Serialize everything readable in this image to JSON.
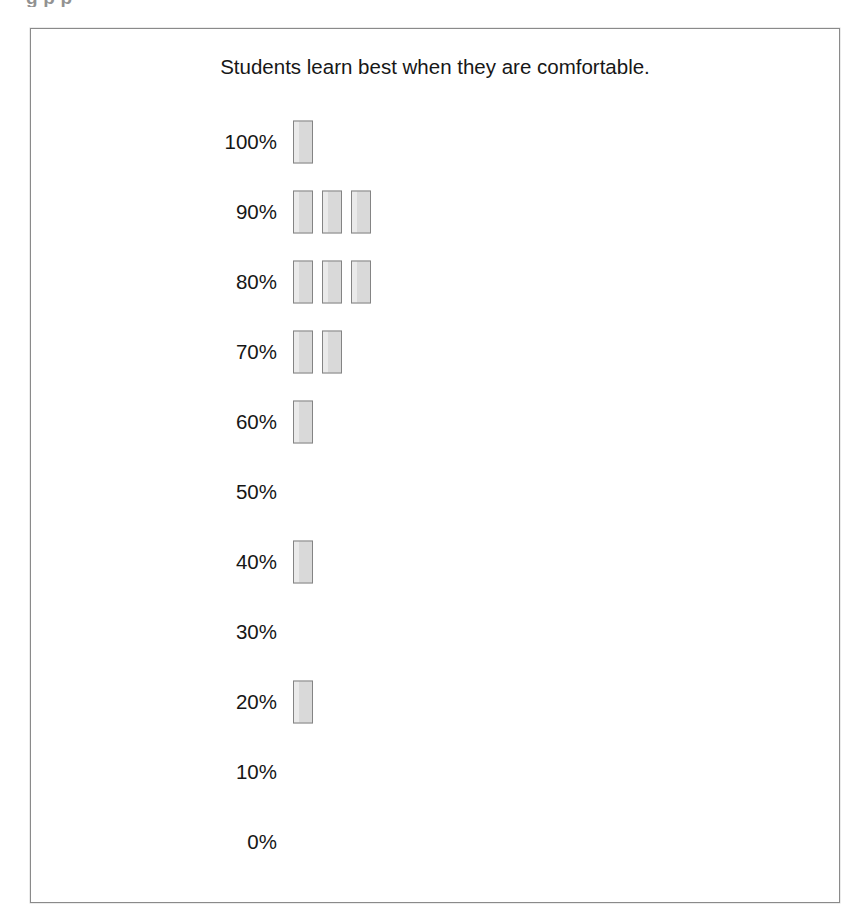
{
  "document": {
    "top_clipped_line": "g                    p        p"
  },
  "figure": {
    "title": "Students learn best when they are comfortable.",
    "border_color": "#8a8a8a",
    "background_color": "#ffffff"
  },
  "bar_style": {
    "fill_color": "#d9d9d9",
    "stroke_color": "#848484"
  },
  "chart_data": {
    "type": "bar",
    "orientation": "horizontal-rows",
    "title": "Students learn best when they are comfortable.",
    "xlabel": "",
    "ylabel": "",
    "grid": false,
    "legend": null,
    "categories": [
      "100%",
      "90%",
      "80%",
      "70%",
      "60%",
      "50%",
      "40%",
      "30%",
      "20%",
      "10%",
      "0%"
    ],
    "values": [
      1,
      3,
      3,
      2,
      1,
      0,
      1,
      0,
      1,
      0,
      0
    ],
    "value_description": "number of respondent markers stacked horizontally at each percentage level",
    "ylim": [
      0,
      3
    ],
    "rows": [
      {
        "label": "100%",
        "count": 1
      },
      {
        "label": "90%",
        "count": 3
      },
      {
        "label": "80%",
        "count": 3
      },
      {
        "label": "70%",
        "count": 2
      },
      {
        "label": "60%",
        "count": 1
      },
      {
        "label": "50%",
        "count": 0
      },
      {
        "label": "40%",
        "count": 1
      },
      {
        "label": "30%",
        "count": 0
      },
      {
        "label": "20%",
        "count": 1
      },
      {
        "label": "10%",
        "count": 0
      },
      {
        "label": "0%",
        "count": 0
      }
    ]
  }
}
